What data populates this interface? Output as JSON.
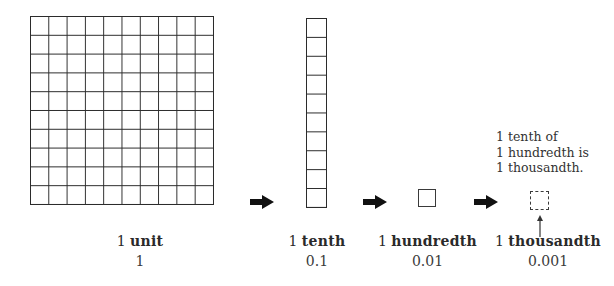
{
  "diagram": {
    "items": [
      {
        "number": "1",
        "name": "unit",
        "value": "1",
        "shape": "10x10 grid"
      },
      {
        "number": "1",
        "name": "tenth",
        "value": "0.1",
        "shape": "1x10 strip"
      },
      {
        "number": "1",
        "name": "hundredth",
        "value": "0.01",
        "shape": "single square"
      },
      {
        "number": "1",
        "name": "thousandth",
        "value": "0.001",
        "shape": "dashed square"
      }
    ],
    "arrows": [
      "arrow-right-icon",
      "arrow-right-icon",
      "arrow-right-icon"
    ],
    "note": {
      "line1": "1 tenth of",
      "line2": "1 hundredth is",
      "line3": "1 thousandth."
    },
    "colors": {
      "stroke": "#2b2b2b",
      "background": "#ffffff"
    }
  }
}
